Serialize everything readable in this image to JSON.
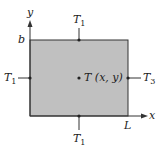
{
  "diagram": {
    "type": "rectangular plate heat conduction boundary conditions",
    "plate_fill": "#c0c0c0",
    "axes": {
      "x_label": "x",
      "y_label": "y"
    },
    "dimensions": {
      "height_label": "b",
      "width_label": "L"
    },
    "boundaries": {
      "top": {
        "symbol": "T",
        "sub": "1"
      },
      "left": {
        "symbol": "T",
        "sub": "1"
      },
      "bottom": {
        "symbol": "T",
        "sub": "1"
      },
      "right": {
        "symbol": "T",
        "sub": "3"
      }
    },
    "interior_point": {
      "label": "T (x, y)"
    }
  }
}
